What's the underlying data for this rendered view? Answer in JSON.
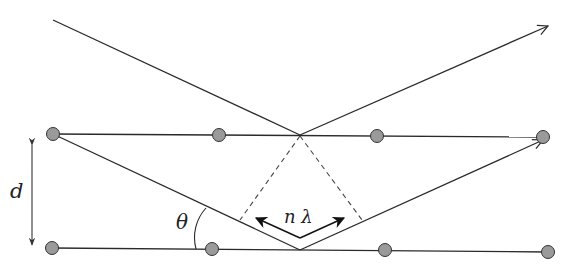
{
  "diagram": {
    "labels": {
      "spacing": "d",
      "angle": "θ",
      "path_difference": "n λ"
    },
    "colors": {
      "line": "#2a2a2a",
      "atom_fill": "#9a9a9a",
      "atom_stroke": "#333333"
    },
    "planes": [
      {
        "name": "upper-plane",
        "atoms": [
          [
            53,
            134
          ],
          [
            219,
            135
          ],
          [
            377,
            136
          ],
          [
            543,
            137
          ]
        ]
      },
      {
        "name": "lower-plane",
        "atoms": [
          [
            52,
            248
          ],
          [
            212,
            249
          ],
          [
            385,
            250
          ],
          [
            548,
            252
          ]
        ]
      }
    ]
  }
}
